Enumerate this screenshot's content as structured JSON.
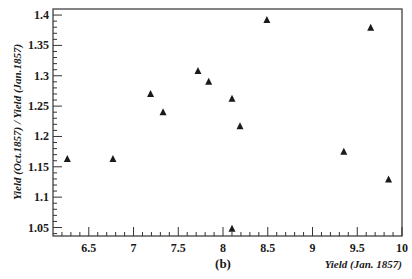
{
  "chart_data": {
    "type": "scatter",
    "title": "",
    "panel_label": "(b)",
    "xlabel": "Yield (Jan. 1857)",
    "ylabel": "Yield (Oct.1857) / Yield (Jan.1857)",
    "xlim": [
      6.1,
      10.0
    ],
    "ylim": [
      1.036,
      1.41
    ],
    "x_ticks": [
      6.5,
      7,
      7.5,
      8,
      8.5,
      9,
      9.5,
      10
    ],
    "x_tick_labels": [
      "6.5",
      "7",
      "7.5",
      "8",
      "8.5",
      "9",
      "9.5",
      "10"
    ],
    "y_ticks": [
      1.05,
      1.1,
      1.15,
      1.2,
      1.25,
      1.3,
      1.35,
      1.4
    ],
    "y_tick_labels": [
      "1.05",
      "1.1",
      "1.15",
      "1.2",
      "1.25",
      "1.3",
      "1.35",
      "1.4"
    ],
    "grid": false,
    "legend": null,
    "marker": "triangle-up",
    "marker_color": "#1a1a1a",
    "series": [
      {
        "name": "points",
        "points": [
          {
            "x": 6.26,
            "y": 1.163
          },
          {
            "x": 6.77,
            "y": 1.163
          },
          {
            "x": 7.19,
            "y": 1.27
          },
          {
            "x": 7.33,
            "y": 1.24
          },
          {
            "x": 7.72,
            "y": 1.308
          },
          {
            "x": 7.84,
            "y": 1.29
          },
          {
            "x": 8.1,
            "y": 1.262
          },
          {
            "x": 8.19,
            "y": 1.217
          },
          {
            "x": 8.49,
            "y": 1.392
          },
          {
            "x": 9.35,
            "y": 1.175
          },
          {
            "x": 9.65,
            "y": 1.379
          },
          {
            "x": 9.85,
            "y": 1.129
          },
          {
            "x": 8.1,
            "y": 1.048
          }
        ]
      }
    ]
  },
  "layout": {
    "plot_left": 53,
    "plot_right": 402,
    "plot_top": 9,
    "plot_bottom": 236
  }
}
